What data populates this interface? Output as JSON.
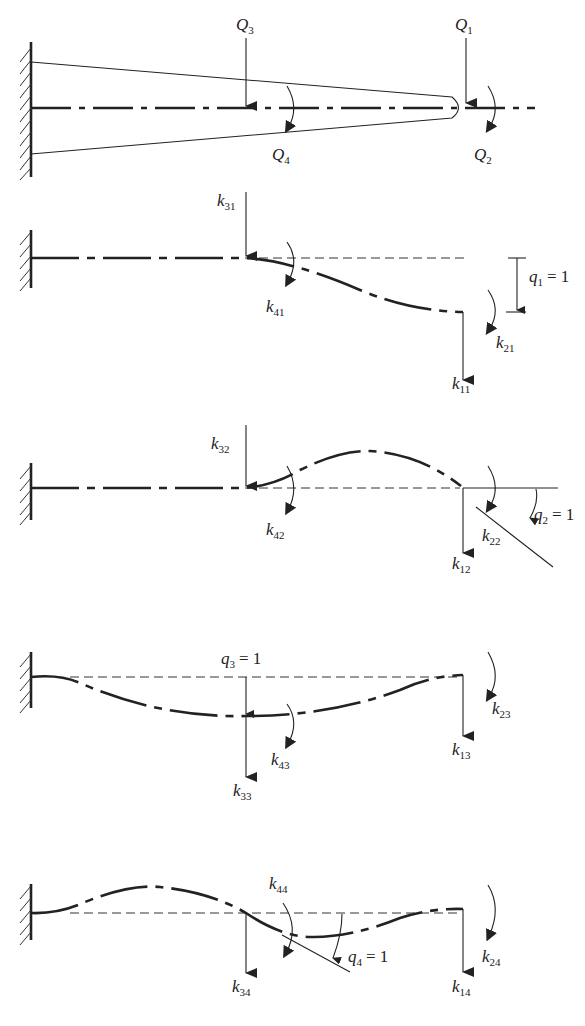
{
  "figure": {
    "panels": [
      {
        "id": "loads",
        "labels": {
          "Q1": {
            "base": "Q",
            "sub": "1"
          },
          "Q2": {
            "base": "Q",
            "sub": "2"
          },
          "Q3": {
            "base": "Q",
            "sub": "3"
          },
          "Q4": {
            "base": "Q",
            "sub": "4"
          }
        }
      },
      {
        "id": "q1",
        "labels": {
          "k31": {
            "base": "k",
            "sub": "31"
          },
          "k41": {
            "base": "k",
            "sub": "41"
          },
          "k21": {
            "base": "k",
            "sub": "21"
          },
          "k11": {
            "base": "k",
            "sub": "11"
          },
          "disp": {
            "base": "q",
            "sub": "1",
            "eq": "= 1"
          }
        }
      },
      {
        "id": "q2",
        "labels": {
          "k32": {
            "base": "k",
            "sub": "32"
          },
          "k42": {
            "base": "k",
            "sub": "42"
          },
          "k22": {
            "base": "k",
            "sub": "22"
          },
          "k12": {
            "base": "k",
            "sub": "12"
          },
          "disp": {
            "base": "q",
            "sub": "2",
            "eq": "= 1"
          }
        }
      },
      {
        "id": "q3",
        "labels": {
          "k33": {
            "base": "k",
            "sub": "33"
          },
          "k43": {
            "base": "k",
            "sub": "43"
          },
          "k23": {
            "base": "k",
            "sub": "23"
          },
          "k13": {
            "base": "k",
            "sub": "13"
          },
          "disp": {
            "base": "q",
            "sub": "3",
            "eq": "= 1"
          }
        }
      },
      {
        "id": "q4",
        "labels": {
          "k44": {
            "base": "k",
            "sub": "44"
          },
          "k34": {
            "base": "k",
            "sub": "34"
          },
          "k24": {
            "base": "k",
            "sub": "24"
          },
          "k14": {
            "base": "k",
            "sub": "14"
          },
          "disp": {
            "base": "q",
            "sub": "4",
            "eq": "= 1"
          }
        }
      }
    ]
  }
}
